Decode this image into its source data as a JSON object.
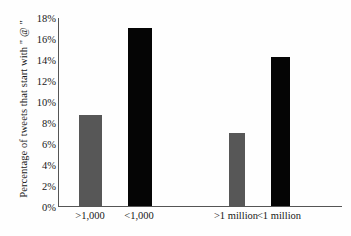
{
  "chart_data": {
    "type": "bar",
    "title": "",
    "subtitle": "",
    "xlabel": "",
    "ylabel": "Percentage of tweets that start with \" @ \"",
    "categories": [
      ">1,000",
      "<1,000",
      ">1 million",
      "<1 million"
    ],
    "values": [
      8.7,
      17.0,
      7.0,
      14.2
    ],
    "series": [
      {
        "name": "Percentage of tweets that start with \" @ \"",
        "values": [
          8.7,
          17.0,
          7.0,
          14.2
        ],
        "colors": [
          "#575757",
          "#050505",
          "#575757",
          "#050505"
        ]
      }
    ],
    "ylim": [
      0,
      18
    ],
    "ytick_step": 2,
    "ytick_labels": [
      "18%",
      "16%",
      "14%",
      "12%",
      "10%",
      "8%",
      "6%",
      "4%",
      "2%",
      "0%"
    ],
    "ytick_values": [
      18,
      16,
      14,
      12,
      10,
      8,
      6,
      4,
      2,
      0
    ],
    "grid": false,
    "legend": "none",
    "axis_color": "#555555",
    "background_color": "#fefefe",
    "bar_colors": {
      "gray": "#575757",
      "black": "#050505"
    },
    "bar_geometry": [
      {
        "category": ">1,000",
        "left_px": 20,
        "width_px": 23,
        "color_key": "gray"
      },
      {
        "category": "<1,000",
        "left_px": 69,
        "width_px": 24,
        "color_key": "black"
      },
      {
        "category": ">1 million",
        "left_px": 170,
        "width_px": 16,
        "color_key": "gray"
      },
      {
        "category": "<1 million",
        "left_px": 212,
        "width_px": 19,
        "color_key": "black"
      }
    ],
    "label_positions_px": [
      32,
      81,
      178,
      221
    ]
  }
}
